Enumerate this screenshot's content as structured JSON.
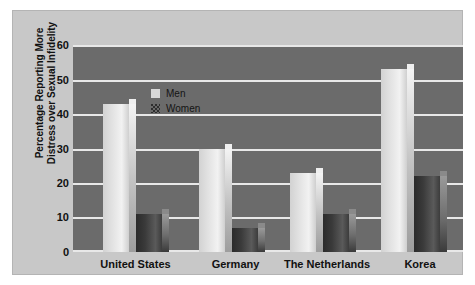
{
  "chart_data": {
    "type": "bar",
    "title": "",
    "subtitle": "",
    "xlabel": "",
    "ylabel": "Percentage Reporting More Distress over Sexual Infidelity",
    "categories": [
      "United States",
      "Germany",
      "The Netherlands",
      "Korea"
    ],
    "series": [
      {
        "name": "Men",
        "values": [
          43,
          30,
          23,
          53
        ],
        "color": "#e8e8e8"
      },
      {
        "name": "Women",
        "values": [
          11,
          7,
          11,
          22
        ],
        "color": "#3a3a3a"
      }
    ],
    "ylim": [
      0,
      60
    ],
    "ytick_labels": [
      "0",
      "10",
      "20",
      "30",
      "40",
      "50",
      "60"
    ],
    "ytick_values": [
      0,
      10,
      20,
      30,
      40,
      50,
      60
    ],
    "grid": true,
    "legend_position": "top-left",
    "legend_entries": [
      "Men",
      "Women"
    ],
    "plot_background": "#6b6b6b",
    "panel_background": "#c8c8c8",
    "gridline_color": "#e8e8e8"
  }
}
